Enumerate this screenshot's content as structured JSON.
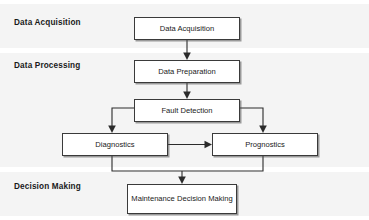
{
  "diagram": {
    "type": "flowchart",
    "stages": [
      {
        "id": "data-acquisition",
        "label": "Data Acquisition"
      },
      {
        "id": "data-processing",
        "label": "Data Processing"
      },
      {
        "id": "decision-making",
        "label": "Decision Making"
      }
    ],
    "nodes": [
      {
        "id": "data-acquisition-node",
        "label": "Data Acquisition",
        "stage": "data-acquisition"
      },
      {
        "id": "data-preparation-node",
        "label": "Data Preparation",
        "stage": "data-processing"
      },
      {
        "id": "fault-detection-node",
        "label": "Fault Detection",
        "stage": "data-processing"
      },
      {
        "id": "diagnostics-node",
        "label": "Diagnostics",
        "stage": "data-processing"
      },
      {
        "id": "prognostics-node",
        "label": "Prognostics",
        "stage": "data-processing"
      },
      {
        "id": "maintenance-node",
        "label": "Maintenance Decision Making",
        "stage": "decision-making"
      }
    ],
    "edges": [
      {
        "from": "data-acquisition-node",
        "to": "data-preparation-node",
        "arrow": "down"
      },
      {
        "from": "data-preparation-node",
        "to": "fault-detection-node",
        "arrow": "down"
      },
      {
        "from": "fault-detection-node",
        "to": "diagnostics-node",
        "arrow": "down-left"
      },
      {
        "from": "fault-detection-node",
        "to": "prognostics-node",
        "arrow": "down-right"
      },
      {
        "from": "diagnostics-node",
        "to": "prognostics-node",
        "arrow": "right"
      },
      {
        "from": "diagnostics-node",
        "to": "maintenance-node",
        "arrow": "down-join"
      },
      {
        "from": "prognostics-node",
        "to": "maintenance-node",
        "arrow": "down-join"
      }
    ],
    "colors": {
      "band_background": "#f4f4f4",
      "page_background": "#ffffff",
      "node_border": "#3a3a3a",
      "node_fill": "#ffffff",
      "connector": "#2b2b2b",
      "text": "#1a1a1a"
    }
  }
}
